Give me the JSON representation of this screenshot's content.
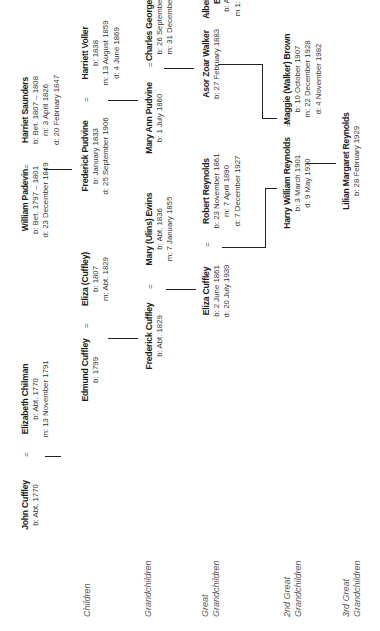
{
  "generation_labels": [
    {
      "text": "Children"
    },
    {
      "text": "Grandchildren"
    },
    {
      "text": "Great Grandchildren"
    },
    {
      "text": "2nd Great Grandchildren"
    },
    {
      "text": "3rd Great Grandchildren"
    }
  ],
  "persons": {
    "john_cuffley": {
      "name": "John Cuffley",
      "lines": [
        "b: Abt. 1770"
      ]
    },
    "elizabeth_chilman": {
      "name": "Elizabeth Chilman",
      "lines": [
        "b: Abt. 1770",
        "m: 13 November 1791"
      ]
    },
    "william_padevin": {
      "name": "William Padevin",
      "lines": [
        "b: Bet. 1797 – 1801",
        "d: 23 December 1849"
      ]
    },
    "harriet_saunders": {
      "name": "Harriet Saunders",
      "lines": [
        "b: Bet. 1807 – 1808",
        "m: 3 April 1826",
        "d: 20 February 1847"
      ]
    },
    "edmund_cuffley": {
      "name": "Edmund Cuffley",
      "lines": [
        "b: 1799"
      ]
    },
    "eliza_cuffley_elder": {
      "name": "Eliza (Cuffley)",
      "lines": [
        "b: 1807",
        "m: Abt. 1829"
      ]
    },
    "frederick_pudvine": {
      "name": "Frederick Pudvine",
      "lines": [
        "b: January 1833",
        "d: 25 September 1906"
      ]
    },
    "harriett_voller": {
      "name": "Harriett Voller",
      "lines": [
        "b: 1838",
        "m: 13 August 1859",
        "d: 4 June 1869"
      ]
    },
    "frederick_cuffley": {
      "name": "Frederick Cuffley",
      "lines": [
        "b: Abt. 1829"
      ]
    },
    "mary_ewins": {
      "name": "Mary (Ulins) Ewins",
      "lines": [
        "b: Abt. 1836",
        "m: 7 January 1855"
      ]
    },
    "mary_ann_pudvine": {
      "name": "Mary Ann Pudvine",
      "lines": [
        "b: 1 July 1860"
      ]
    },
    "charles_george_walker": {
      "name": "Charles George Walker",
      "lines": [
        "b: 26 September 1860",
        "m: 31 December 1882"
      ]
    },
    "eliza_cuffley": {
      "name": "Eliza Cuffley",
      "lines": [
        "b: 2 June 1861",
        "d: 20 July 1939"
      ]
    },
    "robert_reynolds": {
      "name": "Robert Reynolds",
      "lines": [
        "b: 23 November 1861",
        "m: 7 April 1890",
        "d: 7 December 1927"
      ]
    },
    "asor_zoar_walker": {
      "name": "Asor Zoar Walker",
      "lines": [
        "b: 27 February 1883"
      ]
    },
    "albert_edward_brown": {
      "name": "Albert Edward Brown",
      "name_lines": [
        "Albert Edward",
        "Brown"
      ],
      "lines": [
        "b: Abt. 1880",
        "m 1: Abt. 1904"
      ]
    },
    "harry_william_reynolds": {
      "name": "Harry William Reynolds",
      "lines": [
        "b: 3 March 1901",
        "d: 9 May 1970"
      ]
    },
    "maggie_brown": {
      "name": "Maggie (Walker) Brown",
      "lines": [
        "b: 10 October 1907",
        "m: 22 December 1928",
        "d: 4 November 1982"
      ]
    },
    "lilian_margaret_reynolds": {
      "name": "Lilian Margaret Reynolds",
      "lines": [
        "b: 28 February 1929"
      ]
    }
  },
  "marriage_symbol": "="
}
